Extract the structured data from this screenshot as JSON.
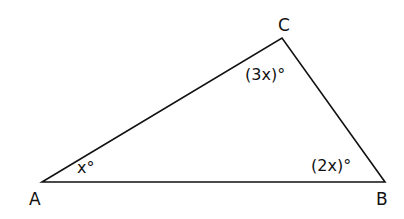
{
  "diagram": {
    "type": "triangle",
    "vertices": {
      "A": {
        "label": "A",
        "angle": "x°"
      },
      "B": {
        "label": "B",
        "angle": "(2x)°"
      },
      "C": {
        "label": "C",
        "angle": "(3x)°"
      }
    },
    "colors": {
      "stroke": "#111111",
      "background": "#ffffff"
    }
  }
}
